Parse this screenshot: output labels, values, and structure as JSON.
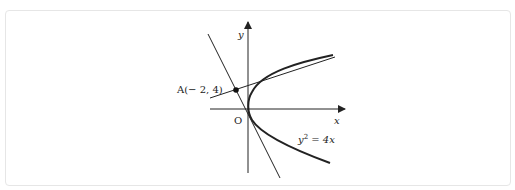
{
  "figure": {
    "type": "parabola-tangent-diagram",
    "axes": {
      "x_label": "x",
      "y_label": "y",
      "origin_label": "O"
    },
    "curve": {
      "equation_label_base": "y",
      "equation_label_exp": "2",
      "equation_label_rest": " = 4x"
    },
    "point": {
      "name": "A",
      "label": "A(− 2, 4)",
      "x": -2,
      "y": 4
    },
    "tangent_lines": [
      {
        "name": "tangent-line-steep",
        "description": "tangent through A touching parabola on lower branch near origin"
      },
      {
        "name": "tangent-line-shallow",
        "description": "tangent through A touching upper branch"
      }
    ],
    "colors": {
      "stroke": "#222222",
      "frame_border": "#e6e6e6",
      "background": "#ffffff"
    }
  }
}
